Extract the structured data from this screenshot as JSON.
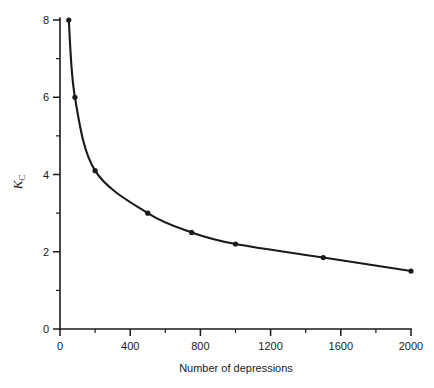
{
  "chart_data": {
    "type": "line",
    "title": "",
    "subtitle": "",
    "xlabel": "Number of depressions",
    "ylabel": "K_C",
    "ylabel_symbol": "K",
    "ylabel_subscript": "C",
    "xlim": [
      0,
      2000
    ],
    "ylim": [
      0,
      8
    ],
    "grid": false,
    "legend": false,
    "legend_position": "none",
    "x_major_ticks": [
      0,
      400,
      800,
      1200,
      1600,
      2000
    ],
    "x_minor_ticks": [
      200,
      600,
      1000,
      1400,
      1800
    ],
    "x_tick_labels": [
      "0",
      "400",
      "800",
      "1200",
      "1600",
      "2000"
    ],
    "y_major_ticks": [
      0,
      2,
      4,
      6,
      8
    ],
    "y_minor_ticks": [
      1,
      3,
      5,
      7
    ],
    "y_tick_labels": [
      "0",
      "2",
      "4",
      "6",
      "8"
    ],
    "series": [
      {
        "name": "Kc vs number of depressions",
        "marker": "filled-circle",
        "color": "#1a1a1a",
        "x": [
          50,
          85,
          200,
          500,
          750,
          1000,
          1500,
          2000
        ],
        "y": [
          8.0,
          6.0,
          4.1,
          3.0,
          2.5,
          2.2,
          1.85,
          1.5
        ]
      }
    ],
    "annotations": []
  },
  "figure": {
    "background_color": "#ffffff",
    "axis_color": "#1a1a1a"
  }
}
